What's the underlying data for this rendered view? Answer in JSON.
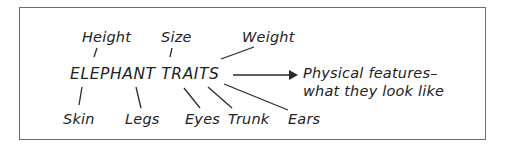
{
  "diagram": {
    "center": "ELEPHANT TRAITS",
    "top_traits": [
      "Height",
      "Size",
      "Weight"
    ],
    "bottom_traits": [
      "Skin",
      "Legs",
      "Eyes",
      "Trunk",
      "Ears"
    ],
    "result": {
      "line1": "Physical features–",
      "line2": "what they look like"
    },
    "icons": [
      "arrow-right-icon"
    ]
  }
}
